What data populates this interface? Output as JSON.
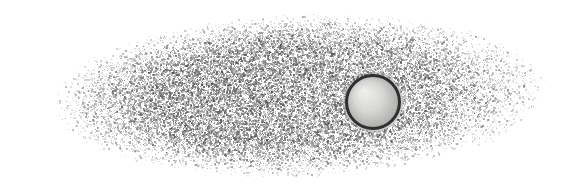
{
  "figure": {
    "width": 573,
    "height": 190,
    "background_color": "#ffffff",
    "caption": "Grayscale micrograph: elongated cloud of fine speckle grains on a white background, containing one circular bead with a dark rim and light interior."
  },
  "chart_data": {
    "type": "scatter",
    "subtitle": "",
    "xlabel": "",
    "ylabel": "",
    "xlim": [
      0,
      573
    ],
    "ylim": [
      0,
      190
    ],
    "grid": false,
    "legend_position": "none",
    "tick_labels_x": [],
    "tick_labels_y": [],
    "annotations": [],
    "background_color": "#ffffff",
    "speckle_field": {
      "description": "Elongated elliptical cloud of fine grayscale speckle grains, densest near the center-left, fading softly toward all edges.",
      "shape": "ellipse",
      "center_x": 300,
      "center_y": 95,
      "radius_x": 248,
      "radius_y": 82,
      "rotation_deg": -2,
      "grain_count": 46000,
      "grain_size_px": [
        1,
        2
      ],
      "min_gray": 60,
      "max_gray": 190,
      "core_opacity": 0.92,
      "edge_feather": 0.42,
      "extent_left_px": 55,
      "extent_right_px": 546,
      "extent_top_px": 12,
      "extent_bottom_px": 176
    },
    "particle": {
      "label": "spherical bead",
      "shape": "circle",
      "center_x": 373,
      "center_y": 102,
      "radius_px": 28,
      "diameter_px": 56,
      "rim_color": "#2f2f2f",
      "rim_width_px": 3,
      "interior_color": "#d8d8d6",
      "interior_highlight_color": "#eeeeec",
      "interior_shadow_color": "#b4b4b2",
      "highlight_offset_x": -9,
      "highlight_offset_y": -10
    }
  }
}
